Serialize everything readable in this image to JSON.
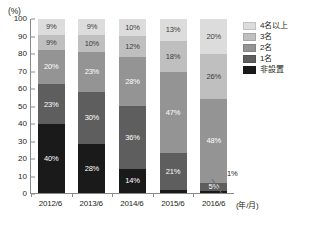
{
  "chart_data": {
    "type": "bar",
    "stacked": true,
    "title": "",
    "subtitle": "",
    "xlabel": "(年/月)",
    "ylabel": "(%)",
    "ylim": [
      0,
      100
    ],
    "ytick_step": 10,
    "grid": false,
    "legend_position": "right",
    "categories": [
      "2012/6",
      "2013/6",
      "2014/6",
      "2015/6",
      "2016/6"
    ],
    "ytick_labels": [
      "100",
      "90",
      "80",
      "70",
      "60",
      "50",
      "40",
      "30",
      "20",
      "10",
      "0"
    ],
    "series": [
      {
        "name": "4名以上",
        "color": "#dcdcdc",
        "values": [
          9,
          9,
          10,
          13,
          20
        ],
        "labels": [
          "9%",
          "9%",
          "10%",
          "13%",
          "20%"
        ]
      },
      {
        "name": "3名",
        "color": "#bfbfbf",
        "values": [
          9,
          10,
          12,
          18,
          26
        ],
        "labels": [
          "9%",
          "10%",
          "12%",
          "18%",
          "26%"
        ]
      },
      {
        "name": "2名",
        "color": "#949494",
        "values": [
          20,
          23,
          28,
          47,
          48
        ],
        "labels": [
          "20%",
          "23%",
          "28%",
          "47%",
          "48%"
        ]
      },
      {
        "name": "1名",
        "color": "#5e5e5e",
        "values": [
          23,
          30,
          36,
          21,
          5
        ],
        "labels": [
          "23%",
          "30%",
          "36%",
          "21%",
          "5%"
        ]
      },
      {
        "name": "非設置",
        "color": "#1a1a1a",
        "values": [
          40,
          28,
          14,
          2,
          1
        ],
        "labels": [
          "40%",
          "28%",
          "14%",
          "",
          ""
        ]
      }
    ],
    "annotations": [
      {
        "text": "1%",
        "series": "非設置",
        "category": "2016/6"
      }
    ]
  },
  "legend": {
    "items": [
      {
        "label": "4名以上",
        "color": "#dcdcdc"
      },
      {
        "label": "3名",
        "color": "#bfbfbf"
      },
      {
        "label": "2名",
        "color": "#949494"
      },
      {
        "label": "1名",
        "color": "#5e5e5e"
      },
      {
        "label": "非設置",
        "color": "#1a1a1a"
      }
    ]
  }
}
